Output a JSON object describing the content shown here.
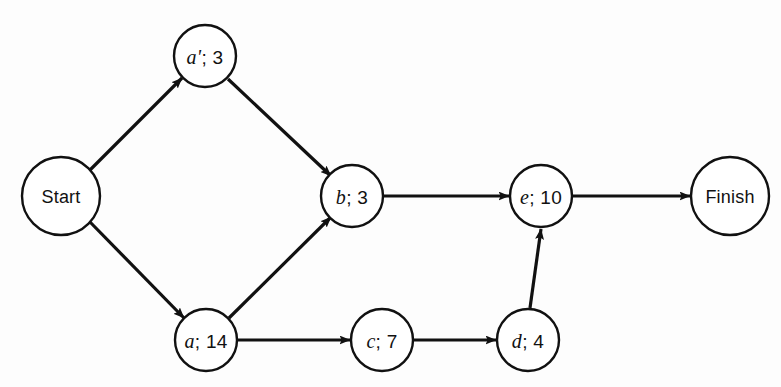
{
  "diagram": {
    "type": "activity-on-node-project-network",
    "background_color": "#fdfdfd",
    "line_color": "#111111",
    "nodes": [
      {
        "id": "start",
        "label": "Start",
        "task": "",
        "duration": "",
        "cx": 61,
        "cy": 196,
        "r": 39,
        "kind": "terminal"
      },
      {
        "id": "aprime",
        "label": "a'; 3",
        "task": "a'",
        "duration": "3",
        "cx": 205,
        "cy": 56,
        "r": 31,
        "kind": "task"
      },
      {
        "id": "b",
        "label": "b; 3",
        "task": "b",
        "duration": "3",
        "cx": 352,
        "cy": 196,
        "r": 31,
        "kind": "task"
      },
      {
        "id": "a",
        "label": "a; 14",
        "task": "a",
        "duration": "14",
        "cx": 206,
        "cy": 340,
        "r": 31,
        "kind": "task"
      },
      {
        "id": "c",
        "label": "c; 7",
        "task": "c",
        "duration": "7",
        "cx": 382,
        "cy": 340,
        "r": 31,
        "kind": "task"
      },
      {
        "id": "d",
        "label": "d; 4",
        "task": "d",
        "duration": "4",
        "cx": 528,
        "cy": 340,
        "r": 31,
        "kind": "task"
      },
      {
        "id": "e",
        "label": "e; 10",
        "task": "e",
        "duration": "10",
        "cx": 541,
        "cy": 196,
        "r": 31,
        "kind": "task"
      },
      {
        "id": "finish",
        "label": "Finish",
        "task": "",
        "duration": "",
        "cx": 730,
        "cy": 196,
        "r": 39,
        "kind": "terminal"
      }
    ],
    "edges": [
      {
        "id": "start-aprime",
        "from": "start",
        "to": "aprime",
        "x1": 90,
        "y1": 170,
        "x2": 182,
        "y2": 78
      },
      {
        "id": "start-a",
        "from": "start",
        "to": "a",
        "x1": 90,
        "y1": 222,
        "x2": 184,
        "y2": 318
      },
      {
        "id": "aprime-b",
        "from": "aprime",
        "to": "b",
        "x1": 228,
        "y1": 79,
        "x2": 331,
        "y2": 176
      },
      {
        "id": "a-b",
        "from": "a",
        "to": "b",
        "x1": 229,
        "y1": 318,
        "x2": 331,
        "y2": 217
      },
      {
        "id": "b-e",
        "from": "b",
        "to": "e",
        "x1": 384,
        "y1": 196,
        "x2": 509,
        "y2": 196
      },
      {
        "id": "a-c",
        "from": "a",
        "to": "c",
        "x1": 238,
        "y1": 340,
        "x2": 350,
        "y2": 340
      },
      {
        "id": "c-d",
        "from": "c",
        "to": "d",
        "x1": 414,
        "y1": 340,
        "x2": 496,
        "y2": 340
      },
      {
        "id": "d-e",
        "from": "d",
        "to": "e",
        "x1": 530,
        "y1": 308,
        "x2": 541,
        "y2": 229
      },
      {
        "id": "e-finish",
        "from": "e",
        "to": "finish",
        "x1": 573,
        "y1": 196,
        "x2": 690,
        "y2": 196
      }
    ]
  }
}
